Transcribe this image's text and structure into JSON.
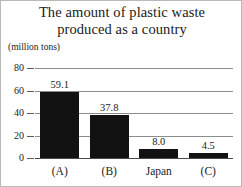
{
  "figure": {
    "title_line_1": "The amount of plastic waste",
    "title_line_2": "produced as a country",
    "unit_label": "(million tons)",
    "background_color": "#ffffff",
    "border_color": "#b9b9b9",
    "bar_color": "#121212",
    "gridline_color": "#8d8d8d",
    "text_color": "#1a1a1a"
  },
  "chart_data": {
    "type": "bar",
    "title": "The amount of plastic waste produced as a country",
    "xlabel": "",
    "ylabel": "(million tons)",
    "categories": [
      "(A)",
      "(B)",
      "Japan",
      "(C)"
    ],
    "values": [
      59.1,
      37.8,
      8.0,
      4.5
    ],
    "value_labels": [
      "59.1",
      "37.8",
      "8.0",
      "4.5"
    ],
    "ylim": [
      0,
      80
    ],
    "yticks": [
      0,
      20,
      40,
      60,
      80
    ],
    "ytick_labels": [
      "0",
      "20",
      "40",
      "60",
      "80"
    ],
    "grid": true,
    "legend": false,
    "legend_position": "none",
    "series": [
      {
        "name": "plastic waste",
        "values": [
          59.1,
          37.8,
          8.0,
          4.5
        ]
      }
    ]
  }
}
